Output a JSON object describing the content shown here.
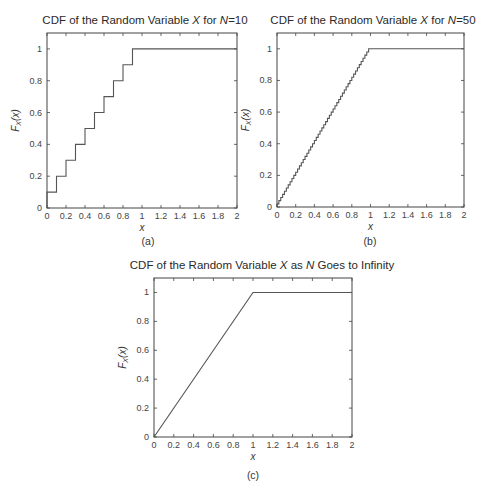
{
  "chart_data": [
    {
      "type": "line",
      "id": "a",
      "title": "CDF of the Random Variable X for N=10",
      "title_parts": [
        {
          "text": "CDF of the Random Variable ",
          "italic": false
        },
        {
          "text": "X",
          "italic": true
        },
        {
          "text": " for ",
          "italic": false
        },
        {
          "text": "N",
          "italic": true
        },
        {
          "text": "=10",
          "italic": false
        }
      ],
      "xlabel": "x",
      "ylabel": "F_X(x)",
      "caption": "(a)",
      "xlim": [
        0,
        2
      ],
      "ylim": [
        0,
        1.1
      ],
      "xticks": [
        "0",
        "0.2",
        "0.4",
        "0.6",
        "0.8",
        "1",
        "1.2",
        "1.4",
        "1.6",
        "1.8",
        "2"
      ],
      "yticks": [
        "0",
        "0.2",
        "0.4",
        "0.6",
        "0.8",
        "1"
      ],
      "steps": 10,
      "series": [
        {
          "name": "CDF",
          "style": "step",
          "x": [
            0,
            0.1,
            0.2,
            0.3,
            0.4,
            0.5,
            0.6,
            0.7,
            0.8,
            0.9,
            2
          ],
          "y": [
            0.1,
            0.2,
            0.3,
            0.4,
            0.5,
            0.6,
            0.7,
            0.8,
            0.9,
            1.0,
            1.0
          ]
        }
      ]
    },
    {
      "type": "line",
      "id": "b",
      "title": "CDF of the Random Variable X for N=50",
      "title_parts": [
        {
          "text": "CDF of the Random Variable ",
          "italic": false
        },
        {
          "text": "X",
          "italic": true
        },
        {
          "text": " for ",
          "italic": false
        },
        {
          "text": "N",
          "italic": true
        },
        {
          "text": "=50",
          "italic": false
        }
      ],
      "xlabel": "x",
      "ylabel": "F_X(x)",
      "caption": "(b)",
      "xlim": [
        0,
        2
      ],
      "ylim": [
        0,
        1.1
      ],
      "xticks": [
        "0",
        "0.2",
        "0.4",
        "0.6",
        "0.8",
        "1",
        "1.2",
        "1.4",
        "1.6",
        "1.8",
        "2"
      ],
      "yticks": [
        "0",
        "0.2",
        "0.4",
        "0.6",
        "0.8",
        "1"
      ],
      "steps": 50,
      "series": [
        {
          "name": "CDF",
          "style": "step",
          "x": [
            0,
            0.98,
            2
          ],
          "y": [
            0.02,
            1.0,
            1.0
          ]
        }
      ]
    },
    {
      "type": "line",
      "id": "c",
      "title": "CDF of the Random Variable X as N Goes to Infinity",
      "title_parts": [
        {
          "text": "CDF of the Random Variable ",
          "italic": false
        },
        {
          "text": "X",
          "italic": true
        },
        {
          "text": " as ",
          "italic": false
        },
        {
          "text": "N",
          "italic": true
        },
        {
          "text": " Goes to Infinity",
          "italic": false
        }
      ],
      "xlabel": "x",
      "ylabel": "F_X(x)",
      "caption": "(c)",
      "xlim": [
        0,
        2
      ],
      "ylim": [
        0,
        1.1
      ],
      "xticks": [
        "0",
        "0.2",
        "0.4",
        "0.6",
        "0.8",
        "1",
        "1.2",
        "1.4",
        "1.6",
        "1.8",
        "2"
      ],
      "yticks": [
        "0",
        "0.2",
        "0.4",
        "0.6",
        "0.8",
        "1"
      ],
      "steps": 0,
      "series": [
        {
          "name": "CDF",
          "style": "line",
          "x": [
            0,
            1,
            2
          ],
          "y": [
            0,
            1,
            1
          ]
        }
      ]
    }
  ]
}
